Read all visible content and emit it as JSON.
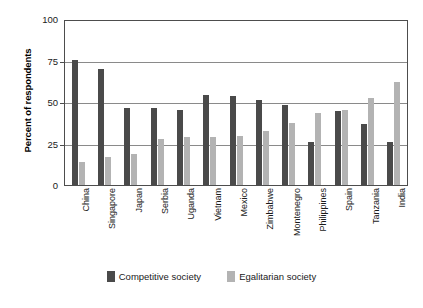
{
  "chart_data": {
    "type": "bar",
    "title": "",
    "xlabel": "",
    "ylabel": "Percent of respondents",
    "ylim": [
      0,
      100
    ],
    "yticks": [
      "0",
      "25",
      "50",
      "75",
      "100"
    ],
    "grid": true,
    "legend_position": "bottom",
    "categories": [
      "China",
      "Singapore",
      "Japan",
      "Serbia",
      "Uganda",
      "Vietnam",
      "Mexico",
      "Zimbabwe",
      "Montenegro",
      "Philippines",
      "Spain",
      "Tanzania",
      "India"
    ],
    "series": [
      {
        "name": "Competitive society",
        "color": "#4a4a4a",
        "values": [
          76,
          71,
          47,
          47,
          46,
          55,
          54,
          52,
          49,
          26,
          45,
          37,
          26
        ]
      },
      {
        "name": "Egalitarian society",
        "color": "#b3b3b3",
        "values": [
          14,
          17,
          19,
          28,
          29,
          29,
          30,
          33,
          38,
          44,
          46,
          53,
          63
        ]
      }
    ]
  },
  "legend": {
    "items": [
      {
        "label": "Competitive society",
        "swatch": "competitive-swatch"
      },
      {
        "label": "Egalitarian society",
        "swatch": "egalitarian-swatch"
      }
    ]
  }
}
